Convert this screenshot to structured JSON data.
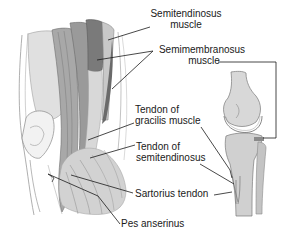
{
  "diagram": {
    "colors": {
      "background": "#ffffff",
      "leader_line": "#1a1a1a",
      "outline": "#8a8a8a",
      "light_fill": "#dcdcdc",
      "mid_fill": "#b4b4b4",
      "dark_fill": "#8c8c8c",
      "darkest_fill": "#707070"
    },
    "labels": [
      {
        "id": "semitendinosus-muscle",
        "line1": "Semitendinosus",
        "line2": "muscle"
      },
      {
        "id": "semimembranosus-muscle",
        "line1": "Semimembranosus",
        "line2": "muscle"
      },
      {
        "id": "tendon-of-gracilis",
        "line1": "Tendon of",
        "line2": "gracilis muscle"
      },
      {
        "id": "tendon-of-semitendinosus",
        "line1": "Tendon of",
        "line2": "semitendinosus"
      },
      {
        "id": "sartorius-tendon",
        "line1": "Sartorius tendon"
      },
      {
        "id": "pes-anserinus",
        "line1": "Pes anserinus"
      }
    ],
    "inset": {
      "description": "Lateral view of knee joint (femur, tibia, fibula) with semimembranosus insertion marked"
    }
  }
}
